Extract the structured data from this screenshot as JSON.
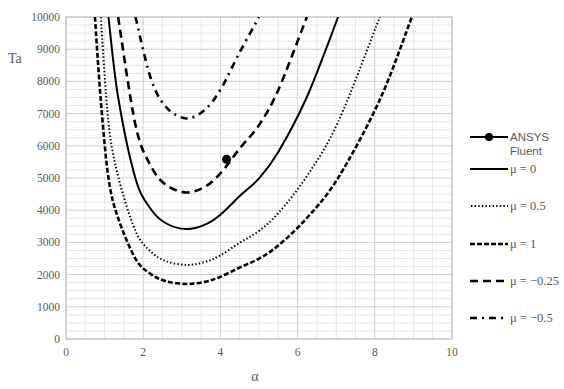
{
  "chart_data": {
    "type": "line",
    "title": "",
    "xlabel": "α",
    "ylabel": "Ta",
    "xlim": [
      0,
      10
    ],
    "ylim": [
      0,
      10000
    ],
    "x_ticks": [
      "0",
      "2",
      "4",
      "6",
      "8",
      "10"
    ],
    "y_ticks": [
      "0",
      "1000",
      "2000",
      "3000",
      "4000",
      "5000",
      "6000",
      "7000",
      "8000",
      "9000",
      "10000"
    ],
    "grid": true,
    "minor_grid": true,
    "legend_position": "right",
    "series": [
      {
        "name": "ANSYS Fluent",
        "style": "marker",
        "points": [
          [
            4.16,
            5580
          ]
        ]
      },
      {
        "name": "μ = 0",
        "style": "solid",
        "points": [
          [
            1.1,
            10000
          ],
          [
            1.35,
            7515
          ],
          [
            1.8,
            4987
          ],
          [
            2.2,
            4031
          ],
          [
            2.6,
            3587
          ],
          [
            3.12,
            3416
          ],
          [
            3.6,
            3553
          ],
          [
            4.0,
            3860
          ],
          [
            4.5,
            4441
          ],
          [
            5.0,
            4987
          ],
          [
            5.5,
            5807
          ],
          [
            6.24,
            7515
          ],
          [
            7.05,
            10000
          ]
        ]
      },
      {
        "name": "μ = 0.5",
        "style": "dotted",
        "points": [
          [
            0.9,
            10000
          ],
          [
            1.1,
            6739
          ],
          [
            1.35,
            5060
          ],
          [
            1.8,
            3358
          ],
          [
            2.2,
            2714
          ],
          [
            2.6,
            2415
          ],
          [
            3.12,
            2300
          ],
          [
            3.6,
            2392
          ],
          [
            4.0,
            2599
          ],
          [
            4.5,
            2990
          ],
          [
            5.0,
            3358
          ],
          [
            5.5,
            3910
          ],
          [
            6.24,
            5060
          ],
          [
            7.05,
            6739
          ],
          [
            8.13,
            10000
          ]
        ]
      },
      {
        "name": "μ = 1",
        "style": "short-dash",
        "points": [
          [
            0.75,
            10000
          ],
          [
            0.9,
            7430
          ],
          [
            1.1,
            5004
          ],
          [
            1.35,
            3758
          ],
          [
            1.8,
            2494
          ],
          [
            2.2,
            2015
          ],
          [
            2.6,
            1793
          ],
          [
            3.12,
            1708
          ],
          [
            3.6,
            1776
          ],
          [
            4.0,
            1930
          ],
          [
            4.5,
            2220
          ],
          [
            5.0,
            2494
          ],
          [
            5.5,
            2904
          ],
          [
            6.24,
            3758
          ],
          [
            7.05,
            5004
          ],
          [
            8.13,
            7430
          ],
          [
            8.96,
            10000
          ]
        ]
      },
      {
        "name": "μ = −0.25",
        "style": "long-dash",
        "points": [
          [
            1.35,
            10000
          ],
          [
            1.8,
            6643
          ],
          [
            2.2,
            5369
          ],
          [
            2.6,
            4778
          ],
          [
            3.12,
            4550
          ],
          [
            3.6,
            4732
          ],
          [
            4.0,
            5142
          ],
          [
            4.5,
            5915
          ],
          [
            5.0,
            6643
          ],
          [
            5.5,
            7735
          ],
          [
            6.24,
            10000
          ]
        ]
      },
      {
        "name": "μ = −0.5",
        "style": "dash-dot",
        "points": [
          [
            1.8,
            10000
          ],
          [
            2.2,
            8083
          ],
          [
            2.6,
            7193
          ],
          [
            3.12,
            6850
          ],
          [
            3.6,
            7124
          ],
          [
            4.0,
            7741
          ],
          [
            4.5,
            8905
          ],
          [
            5.0,
            10000
          ]
        ]
      }
    ]
  },
  "legend": {
    "items": [
      {
        "label": "ANSYS Fluent"
      },
      {
        "label": "μ = 0"
      },
      {
        "label": "μ = 0.5"
      },
      {
        "label": "μ = 1"
      },
      {
        "label": "μ = −0.25"
      },
      {
        "label": "μ = −0.5"
      }
    ]
  },
  "colors": {
    "line": "#000000",
    "grid": "#d9d9d9",
    "axis": "#bfbfbf",
    "text": "#595959"
  }
}
